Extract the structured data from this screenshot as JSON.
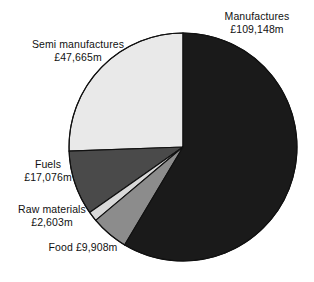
{
  "chart_data": {
    "type": "pie",
    "title": "",
    "subtitle": "",
    "xlabel": "",
    "ylabel": "",
    "currency_symbol": "£",
    "unit_suffix": "m",
    "total": 186400,
    "legend_position": "outside-labels",
    "grid": false,
    "start_angle_deg": 0,
    "direction": "clockwise",
    "center": {
      "x": 183,
      "y": 147
    },
    "radius": 114,
    "categories": [
      "Manufactures",
      "Food",
      "Raw materials",
      "Fuels",
      "Semi manufactures"
    ],
    "values": [
      109148,
      9908,
      2603,
      17076,
      47665
    ],
    "slices": [
      {
        "name": "Manufactures",
        "value": 109148,
        "value_text": "£109,148m",
        "label_line1": "Manufactures",
        "label_line2": "£109,148m",
        "percent": 58.6,
        "angle_deg": 210.8,
        "color": "#1a1a1a"
      },
      {
        "name": "Food",
        "value": 9908,
        "value_text": "£9,908m",
        "label_line1": "Food £9,908m",
        "label_line2": "",
        "percent": 5.3,
        "angle_deg": 19.1,
        "color": "#8c8c8c"
      },
      {
        "name": "Raw materials",
        "value": 2603,
        "value_text": "£2,603m",
        "label_line1": "Raw materials",
        "label_line2": "£2,603m",
        "percent": 1.4,
        "angle_deg": 5.0,
        "color": "#d9d9d9"
      },
      {
        "name": "Fuels",
        "value": 17076,
        "value_text": "£17,076m",
        "label_line1": "Fuels",
        "label_line2": "£17,076m",
        "percent": 9.2,
        "angle_deg": 33.0,
        "color": "#4a4a4a"
      },
      {
        "name": "Semi manufactures",
        "value": 47665,
        "value_text": "£47,665m",
        "label_line1": "Semi manufactures",
        "label_line2": "£47,665m",
        "percent": 25.6,
        "angle_deg": 92.1,
        "color": "#e9e9e9"
      }
    ],
    "colors": {
      "manufactures": "#1a1a1a",
      "food": "#8c8c8c",
      "raw_materials": "#d9d9d9",
      "fuels": "#4a4a4a",
      "semi_manufactures": "#e9e9e9",
      "outline": "#111111",
      "background": "#ffffff",
      "text": "#111111"
    }
  }
}
